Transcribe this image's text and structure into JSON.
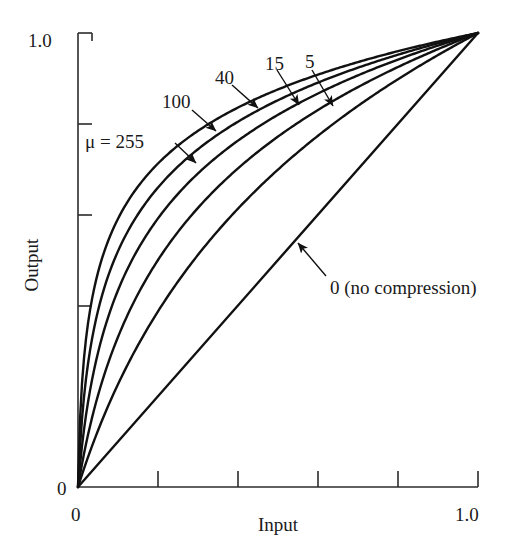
{
  "chart_data": {
    "type": "line",
    "title": "",
    "xlabel": "Input",
    "ylabel": "Output",
    "xlim": [
      0,
      1.0
    ],
    "ylim": [
      0,
      1.0
    ],
    "grid": false,
    "legend_position": "inline-annotations",
    "formula": "y = ln(1 + mu*x) / ln(1 + mu)",
    "x_ticks": [
      "0",
      "",
      "",
      "",
      "",
      "1.0"
    ],
    "x_tick_values": [
      0,
      0.2,
      0.4,
      0.6,
      0.8,
      1.0
    ],
    "y_ticks": [
      "0",
      "",
      "",
      "",
      "",
      "1.0"
    ],
    "y_tick_values": [
      0,
      0.2,
      0.4,
      0.6,
      0.8,
      1.0
    ],
    "x_axis_min_label": "0",
    "x_axis_max_label": "1.0",
    "y_axis_min_label": "0",
    "y_axis_max_label": "1.0",
    "series": [
      {
        "name": "mu = 255",
        "mu": 255,
        "label": "μ = 255",
        "x": [
          0,
          0.02,
          0.05,
          0.1,
          0.15,
          0.2,
          0.3,
          0.4,
          0.5,
          0.6,
          0.7,
          0.8,
          0.9,
          1.0
        ],
        "values": [
          0,
          0.303,
          0.44,
          0.561,
          0.631,
          0.681,
          0.751,
          0.8,
          0.838,
          0.87,
          0.896,
          0.919,
          0.939,
          1.0
        ]
      },
      {
        "name": "100",
        "mu": 100,
        "label": "100",
        "x": [
          0,
          0.02,
          0.05,
          0.1,
          0.15,
          0.2,
          0.3,
          0.4,
          0.5,
          0.6,
          0.7,
          0.8,
          0.9,
          1.0
        ],
        "values": [
          0,
          0.237,
          0.379,
          0.52,
          0.6,
          0.657,
          0.738,
          0.795,
          0.84,
          0.876,
          0.907,
          0.933,
          0.957,
          1.0
        ]
      },
      {
        "name": "40",
        "mu": 40,
        "label": "40",
        "x": [
          0,
          0.02,
          0.05,
          0.1,
          0.15,
          0.2,
          0.3,
          0.4,
          0.5,
          0.6,
          0.7,
          0.8,
          0.9,
          1.0
        ],
        "values": [
          0,
          0.155,
          0.285,
          0.438,
          0.534,
          0.604,
          0.705,
          0.778,
          0.835,
          0.882,
          0.922,
          0.957,
          0.988,
          1.0
        ]
      },
      {
        "name": "15",
        "mu": 15,
        "label": "15",
        "x": [
          0,
          0.02,
          0.05,
          0.1,
          0.15,
          0.2,
          0.3,
          0.4,
          0.5,
          0.6,
          0.7,
          0.8,
          0.9,
          1.0
        ],
        "values": [
          0,
          0.093,
          0.197,
          0.344,
          0.45,
          0.533,
          0.659,
          0.753,
          0.828,
          0.89,
          0.944,
          0.99,
          1.0,
          1.0
        ]
      },
      {
        "name": "5",
        "mu": 5,
        "label": "5",
        "x": [
          0,
          0.02,
          0.05,
          0.1,
          0.15,
          0.2,
          0.3,
          0.4,
          0.5,
          0.6,
          0.7,
          0.8,
          0.9,
          1.0
        ],
        "values": [
          0,
          0.053,
          0.127,
          0.236,
          0.329,
          0.41,
          0.543,
          0.652,
          0.743,
          0.822,
          0.891,
          0.951,
          1.0,
          1.0
        ]
      },
      {
        "name": "0 (no compression)",
        "mu": 0,
        "label": "0 (no compression)",
        "x": [
          0,
          1.0
        ],
        "values": [
          0,
          1.0
        ]
      }
    ],
    "annotations": [
      {
        "text": "μ = 255",
        "name": "mu-255"
      },
      {
        "text": "100",
        "name": "mu-100"
      },
      {
        "text": "40",
        "name": "mu-40"
      },
      {
        "text": "15",
        "name": "mu-15"
      },
      {
        "text": "5",
        "name": "mu-5"
      },
      {
        "text": "0 (no compression)",
        "name": "mu-0"
      }
    ],
    "colors": {
      "curve": "#111111",
      "axis": "#2b2b2b",
      "background": "#ffffff",
      "text": "#1a1a1a"
    }
  },
  "figure": {
    "y_axis_title": "Output",
    "x_axis_title": "Input",
    "y_top_label": "1.0",
    "y_zero_label": "0",
    "x_zero_label": "0",
    "x_max_label": "1.0",
    "label_mu255": "μ = 255",
    "label_100": "100",
    "label_40": "40",
    "label_15": "15",
    "label_5": "5",
    "label_0": "0 (no compression)"
  }
}
